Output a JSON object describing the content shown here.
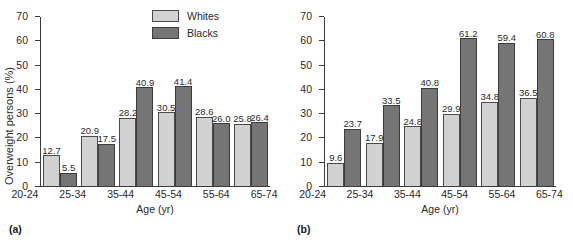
{
  "legend": {
    "entries": [
      {
        "label": "Whites",
        "color": "#d2d2d2"
      },
      {
        "label": "Blacks",
        "color": "#757575"
      }
    ]
  },
  "panels": [
    {
      "caption": "(a)"
    },
    {
      "caption": "(b)"
    }
  ],
  "chart_data": [
    {
      "type": "bar",
      "panel": "(a)",
      "title": "",
      "xlabel": "Age (yr)",
      "ylabel": "Overweight persons (%)",
      "categories": [
        "20-24",
        "25-34",
        "35-44",
        "45-54",
        "55-64",
        "65-74"
      ],
      "ylim": [
        0,
        70
      ],
      "yticks": [
        0,
        10,
        20,
        30,
        40,
        50,
        60,
        70
      ],
      "ytick_labels": [
        "0",
        "10",
        "20",
        "30",
        "40",
        "50",
        "60",
        "70"
      ],
      "grid": false,
      "legend_position": "top-right",
      "series": [
        {
          "name": "Whites",
          "color": "#d2d2d2",
          "values": [
            12.7,
            20.9,
            28.2,
            30.5,
            28.6,
            25.8
          ],
          "labels": [
            "12.7",
            "20.9",
            "28.2",
            "30.5",
            "28.6",
            "25.8"
          ]
        },
        {
          "name": "Blacks",
          "color": "#757575",
          "values": [
            5.5,
            17.5,
            40.9,
            41.4,
            26.0,
            26.4
          ],
          "labels": [
            "5.5",
            "17.5",
            "40.9",
            "41.4",
            "26.0",
            "26.4"
          ]
        }
      ]
    },
    {
      "type": "bar",
      "panel": "(b)",
      "title": "",
      "xlabel": "Age (yr)",
      "ylabel": "",
      "categories": [
        "20-24",
        "25-34",
        "35-44",
        "45-54",
        "55-64",
        "65-74"
      ],
      "ylim": [
        0,
        70
      ],
      "yticks": [
        0,
        10,
        20,
        30,
        40,
        50,
        60,
        70
      ],
      "ytick_labels": [
        "0",
        "10",
        "20",
        "30",
        "40",
        "50",
        "60",
        "70"
      ],
      "grid": false,
      "legend_position": "none",
      "series": [
        {
          "name": "Whites",
          "color": "#d2d2d2",
          "values": [
            9.6,
            17.9,
            24.8,
            29.9,
            34.8,
            36.5
          ],
          "labels": [
            "9.6",
            "17.9",
            "24.8",
            "29.9",
            "34.8",
            "36.5"
          ]
        },
        {
          "name": "Blacks",
          "color": "#757575",
          "values": [
            23.7,
            33.5,
            40.8,
            61.2,
            59.4,
            60.8
          ],
          "labels": [
            "23.7",
            "33.5",
            "40.8",
            "61.2",
            "59.4",
            "60.8"
          ]
        }
      ]
    }
  ]
}
